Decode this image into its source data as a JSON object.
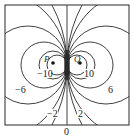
{
  "diagram": {
    "type": "contour-map",
    "points": [
      {
        "label": "P",
        "x": 50,
        "y": 62
      },
      {
        "label": "Q",
        "x": 84,
        "y": 62
      }
    ],
    "contour_labels": [
      {
        "text": "−10",
        "x": 43,
        "y": 76
      },
      {
        "text": "10",
        "x": 86,
        "y": 76
      },
      {
        "text": "−6",
        "x": 21,
        "y": 92
      },
      {
        "text": "6",
        "x": 110,
        "y": 92
      },
      {
        "text": "−2",
        "x": 51,
        "y": 116
      },
      {
        "text": "2",
        "x": 79,
        "y": 116
      },
      {
        "text": "0",
        "x": 67,
        "y": 134
      }
    ],
    "line_color": "#2a2a2a"
  }
}
